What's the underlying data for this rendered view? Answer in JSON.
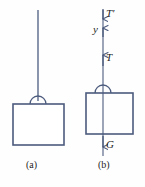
{
  "figure": {
    "stroke_color": "#4c5b7d",
    "background_color": "#fefefe",
    "text_color": "#1e1e1e",
    "width": 145,
    "height": 187
  },
  "panels": [
    {
      "id": "a",
      "caption": "(a)",
      "description": "Block suspended by a vertical string with a handle",
      "elements": {
        "string_label": "string",
        "handle_label": "handle",
        "block_label": "block"
      }
    },
    {
      "id": "b",
      "caption": "(b)",
      "description": "Free-body diagram of the suspended block with force vectors",
      "axis": {
        "name": "y",
        "direction": "up"
      },
      "forces": [
        {
          "symbol": "T′",
          "name": "tension-on-support",
          "direction": "down"
        },
        {
          "symbol": "T",
          "name": "tension-on-block",
          "direction": "up"
        },
        {
          "symbol": "G",
          "name": "weight",
          "direction": "down"
        }
      ],
      "elements": {
        "axis_line_label": "y-axis",
        "handle_label": "handle",
        "block_label": "block"
      }
    }
  ]
}
